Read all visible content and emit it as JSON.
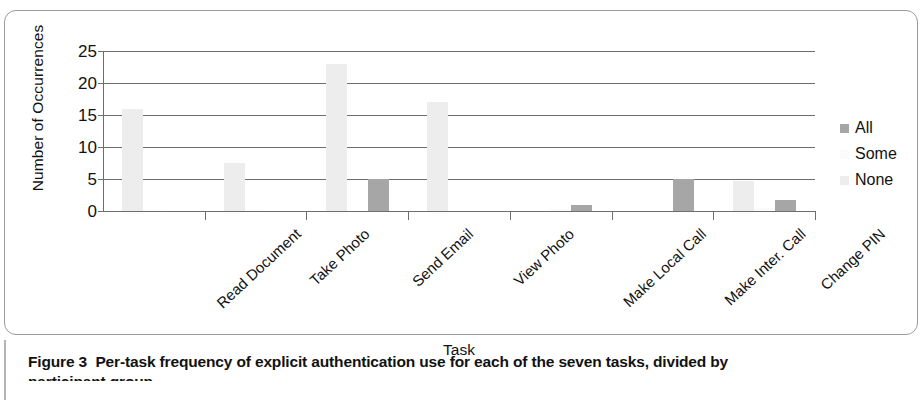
{
  "figure": {
    "caption_label": "Figure 3",
    "caption_text": "Per-task frequency of explicit authentication use for each of the seven tasks, divided by",
    "caption_line2": "participant group"
  },
  "chart_data": {
    "type": "bar",
    "title": "",
    "xlabel": "Task",
    "ylabel": "Number of Occurrences",
    "ylim": [
      0,
      25
    ],
    "yticks": [
      0,
      5,
      10,
      15,
      20,
      25
    ],
    "grid": true,
    "legend_position": "right",
    "categories": [
      "Read Document",
      "Take Photo",
      "Send Email",
      "View Photo",
      "Make Local Call",
      "Make Inter. Call",
      "Change PIN"
    ],
    "series": [
      {
        "name": "All",
        "color": "#a6a6a6",
        "values": [
          0,
          0,
          5,
          0,
          1,
          5,
          1.7
        ]
      },
      {
        "name": "Some",
        "color": "#fbfbfb",
        "values": [
          0.1,
          0.1,
          0,
          0,
          0.3,
          0,
          0.4
        ]
      },
      {
        "name": "None",
        "color": "#ededed",
        "values": [
          16,
          7.5,
          23,
          17,
          0,
          0,
          4.7
        ]
      }
    ]
  }
}
